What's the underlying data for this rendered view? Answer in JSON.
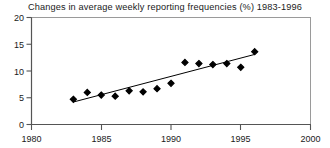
{
  "chart_data": {
    "type": "scatter",
    "title": "Changes in average weekly reporting frequencies (%) 1983-1996",
    "xlabel": "",
    "ylabel": "",
    "xlim": [
      1980,
      2000
    ],
    "ylim": [
      0,
      20
    ],
    "xticks": [
      1980,
      1985,
      1990,
      1995,
      2000
    ],
    "xtick_labels": [
      "1980",
      "1985",
      "1990",
      "1995",
      "2000"
    ],
    "yticks": [
      0,
      5,
      10,
      15,
      20
    ],
    "ytick_labels": [
      "0",
      "5",
      "10",
      "15",
      "20"
    ],
    "grid": false,
    "legend": "none",
    "marker": "filled-diamond",
    "marker_color": "#000000",
    "line_color": "#000000",
    "axis_color": "#8a8a8a",
    "x": [
      1983,
      1984,
      1985,
      1986,
      1987,
      1988,
      1989,
      1990,
      1991,
      1992,
      1993,
      1994,
      1995,
      1996
    ],
    "values": [
      4.7,
      6.0,
      5.5,
      5.3,
      6.3,
      6.1,
      6.7,
      7.7,
      11.6,
      11.4,
      11.2,
      11.4,
      10.7,
      13.6
    ],
    "series": [
      {
        "name": "Average weekly reporting frequency change (%)",
        "x": [
          1983,
          1984,
          1985,
          1986,
          1987,
          1988,
          1989,
          1990,
          1991,
          1992,
          1993,
          1994,
          1995,
          1996
        ],
        "values": [
          4.7,
          6.0,
          5.5,
          5.3,
          6.3,
          6.1,
          6.7,
          7.7,
          11.6,
          11.4,
          11.2,
          11.4,
          10.7,
          13.6
        ]
      },
      {
        "name": "Trend line",
        "type": "line",
        "x": [
          1983,
          1996
        ],
        "values": [
          4.2,
          13.1
        ]
      }
    ]
  }
}
